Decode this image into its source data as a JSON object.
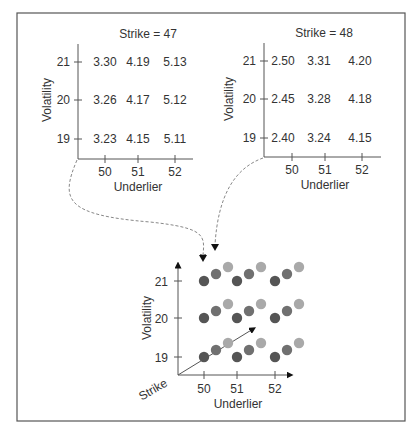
{
  "panels": [
    {
      "title": "Strike = 47",
      "xlabel": "Underlier",
      "ylabel": "Volatility",
      "x_ticks": [
        "50",
        "51",
        "52"
      ],
      "y_ticks": [
        "21",
        "20",
        "19"
      ],
      "rows": [
        [
          "3.30",
          "4.19",
          "5.13"
        ],
        [
          "3.26",
          "4.17",
          "5.12"
        ],
        [
          "3.23",
          "4.15",
          "5.11"
        ]
      ]
    },
    {
      "title": "Strike = 48",
      "xlabel": "Underlier",
      "ylabel": "Volatility",
      "x_ticks": [
        "50",
        "51",
        "52"
      ],
      "y_ticks": [
        "21",
        "20",
        "19"
      ],
      "rows": [
        [
          "2.50",
          "3.31",
          "4.20"
        ],
        [
          "2.45",
          "3.28",
          "4.18"
        ],
        [
          "2.40",
          "3.24",
          "4.15"
        ]
      ]
    }
  ],
  "cube": {
    "xlabel": "Underlier",
    "ylabel": "Volatility",
    "zlabel": "Strike",
    "x_ticks": [
      "50",
      "51",
      "52"
    ],
    "y_ticks": [
      "21",
      "20",
      "19"
    ],
    "dot_colors": [
      "#555555",
      "#707070",
      "#a9a9a9"
    ]
  },
  "chart_data": {
    "type": "table",
    "dimensions": [
      "Strike",
      "Underlier",
      "Volatility"
    ],
    "tables": [
      {
        "strike": 47,
        "underlier": [
          50,
          51,
          52
        ],
        "volatility": [
          21,
          20,
          19
        ],
        "values": [
          [
            3.3,
            4.19,
            5.13
          ],
          [
            3.26,
            4.17,
            5.12
          ],
          [
            3.23,
            4.15,
            5.11
          ]
        ]
      },
      {
        "strike": 48,
        "underlier": [
          50,
          51,
          52
        ],
        "volatility": [
          21,
          20,
          19
        ],
        "values": [
          [
            2.5,
            3.31,
            4.2
          ],
          [
            2.45,
            3.28,
            4.18
          ],
          [
            2.4,
            3.24,
            4.15
          ]
        ]
      }
    ],
    "cube_grid": {
      "underlier": [
        50,
        51,
        52
      ],
      "volatility": [
        19,
        20,
        21
      ],
      "strike_layers": 3
    }
  }
}
